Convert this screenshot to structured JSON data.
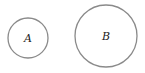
{
  "diagram": {
    "circles": [
      {
        "id": "A",
        "label": "A",
        "cx": 28,
        "cy": 38,
        "r": 20
      },
      {
        "id": "B",
        "label": "B",
        "cx": 106,
        "cy": 36,
        "r": 31
      }
    ],
    "stroke_color": "#8a8a8a",
    "background": "#ffffff"
  }
}
